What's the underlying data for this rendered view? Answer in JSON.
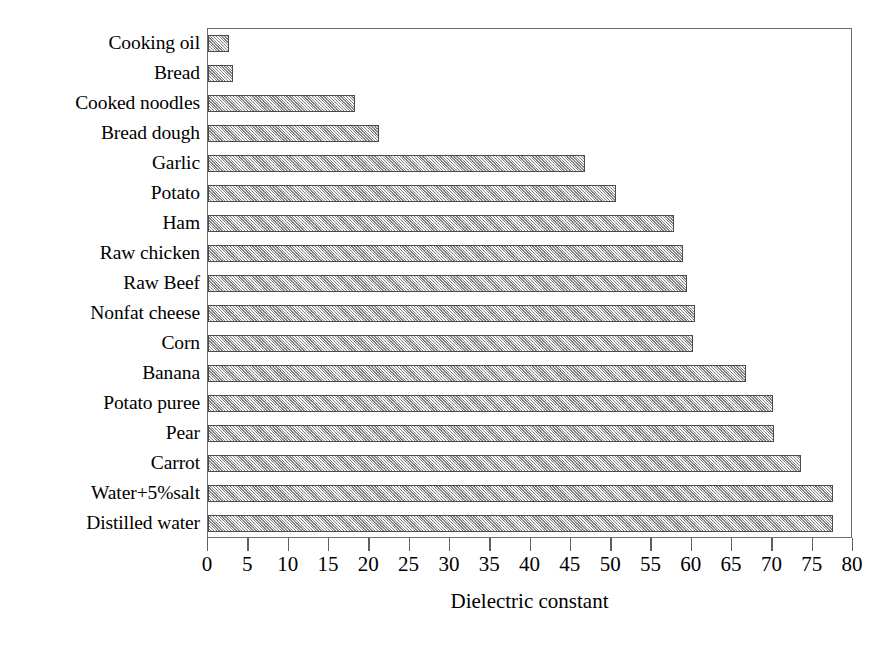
{
  "chart_data": {
    "type": "bar",
    "orientation": "horizontal",
    "title": "",
    "xlabel": "Dielectric constant",
    "ylabel": "",
    "xlim": [
      0,
      80
    ],
    "xticks": [
      0,
      5,
      10,
      15,
      20,
      25,
      30,
      35,
      40,
      45,
      50,
      55,
      60,
      65,
      70,
      75,
      80
    ],
    "xtick_labels": [
      "0",
      "5",
      "10",
      "15",
      "20",
      "25",
      "30",
      "35",
      "40",
      "45",
      "50",
      "55",
      "60",
      "65",
      "70",
      "75",
      "80"
    ],
    "grid": false,
    "legend": null,
    "bar_style": {
      "fill_color": "#b3b3b3",
      "edge_color": "#4a4a4a",
      "pattern": "dotted-crosshatch"
    },
    "categories": [
      "Cooking oil",
      "Bread",
      "Cooked noodles",
      "Bread dough",
      "Garlic",
      "Potato",
      "Ham",
      "Raw chicken",
      "Raw Beef",
      "Nonfat cheese",
      "Corn",
      "Banana",
      "Potato puree",
      "Pear",
      "Carrot",
      "Water+5%salt",
      "Distilled water"
    ],
    "values": [
      2.6,
      3.1,
      18.2,
      21.2,
      46.8,
      50.6,
      57.8,
      58.9,
      59.4,
      60.4,
      60.2,
      66.7,
      70.1,
      70.2,
      73.6,
      77.5,
      77.5
    ]
  }
}
